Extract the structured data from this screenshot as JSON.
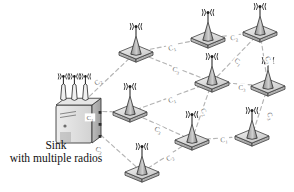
{
  "figure": {
    "type": "network-topology-diagram",
    "background_color": "#ffffff",
    "line_color": "#b4b4b4",
    "node_fill": "#d9d9d9",
    "node_stroke": "#3a3a3a",
    "label_color": "#6f6f6f"
  },
  "caption": {
    "line1": "Sink",
    "line2": "with multiple radios"
  },
  "sink": {
    "id": "sink",
    "name": "Sink",
    "radio_count": 3,
    "x": 56,
    "y": 105,
    "antenna_labels": [
      "((*))",
      "((*))",
      "((*))"
    ]
  },
  "nodes": [
    {
      "id": "n1",
      "label": "",
      "x": 136,
      "y": 52
    },
    {
      "id": "n2",
      "label": "",
      "x": 208,
      "y": 38
    },
    {
      "id": "n3",
      "label": "",
      "x": 260,
      "y": 32
    },
    {
      "id": "n4",
      "label": "",
      "x": 212,
      "y": 82
    },
    {
      "id": "n5",
      "label": "",
      "x": 268,
      "y": 86
    },
    {
      "id": "n6",
      "label": "",
      "x": 130,
      "y": 112
    },
    {
      "id": "n7",
      "label": "",
      "x": 192,
      "y": 140
    },
    {
      "id": "n8",
      "label": "",
      "x": 252,
      "y": 136
    },
    {
      "id": "n9",
      "label": "",
      "x": 142,
      "y": 172
    }
  ],
  "links": [
    {
      "from": "sink",
      "to": "n1",
      "label": "C",
      "sub": "2",
      "lx": 98,
      "ly": 82,
      "rot": -34
    },
    {
      "from": "sink",
      "to": "n6",
      "label": "C",
      "sub": "1",
      "lx": 90,
      "ly": 118,
      "rot": 0
    },
    {
      "from": "sink",
      "to": "n9",
      "label": "C",
      "sub": "3",
      "lx": 99,
      "ly": 150,
      "rot": 26
    },
    {
      "from": "n1",
      "to": "n2",
      "label": "C",
      "sub": "1",
      "lx": 172,
      "ly": 48,
      "rot": -16
    },
    {
      "from": "n2",
      "to": "n3",
      "label": "C",
      "sub": "2",
      "lx": 234,
      "ly": 38,
      "rot": -10
    },
    {
      "from": "n1",
      "to": "n4",
      "label": "C",
      "sub": "3",
      "lx": 176,
      "ly": 70,
      "rot": 18
    },
    {
      "from": "n3",
      "to": "n4",
      "label": "C",
      "sub": "1",
      "lx": 238,
      "ly": 62,
      "rot": 38
    },
    {
      "from": "n3",
      "to": "n5",
      "label": "C",
      "sub": "2",
      "lx": 268,
      "ly": 60,
      "rot": 70
    },
    {
      "from": "n4",
      "to": "n5",
      "label": "C",
      "sub": "3",
      "lx": 242,
      "ly": 88,
      "rot": 4
    },
    {
      "from": "n6",
      "to": "n4",
      "label": "C",
      "sub": "1",
      "lx": 172,
      "ly": 100,
      "rot": -16
    },
    {
      "from": "n4",
      "to": "n7",
      "label": "C",
      "sub": "2",
      "lx": 204,
      "ly": 112,
      "rot": 62
    },
    {
      "from": "n6",
      "to": "n7",
      "label": "C",
      "sub": "3",
      "lx": 158,
      "ly": 130,
      "rot": 26
    },
    {
      "from": "n7",
      "to": "n8",
      "label": "C",
      "sub": "1",
      "lx": 224,
      "ly": 140,
      "rot": -4
    },
    {
      "from": "n5",
      "to": "n8",
      "label": "C",
      "sub": "3",
      "lx": 270,
      "ly": 116,
      "rot": 72
    },
    {
      "from": "n9",
      "to": "n7",
      "label": "C",
      "sub": "2",
      "lx": 170,
      "ly": 158,
      "rot": -28
    }
  ]
}
